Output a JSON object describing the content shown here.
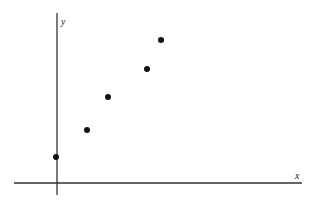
{
  "chart_data": {
    "type": "scatter",
    "title": "",
    "xlabel": "x",
    "ylabel": "y",
    "grid": false,
    "legend": null,
    "tick_labels": false,
    "x": [
      0,
      3.1,
      5.2,
      9.1,
      10.5
    ],
    "y": [
      2.6,
      5.3,
      8.6,
      11.4,
      14.3
    ],
    "xlim": [
      -4.3,
      24.5
    ],
    "ylim": [
      -1.2,
      17.0
    ],
    "point_color": "#111111",
    "axis_color": "#333333"
  },
  "labels": {
    "x_axis": "x",
    "y_axis": "y"
  }
}
